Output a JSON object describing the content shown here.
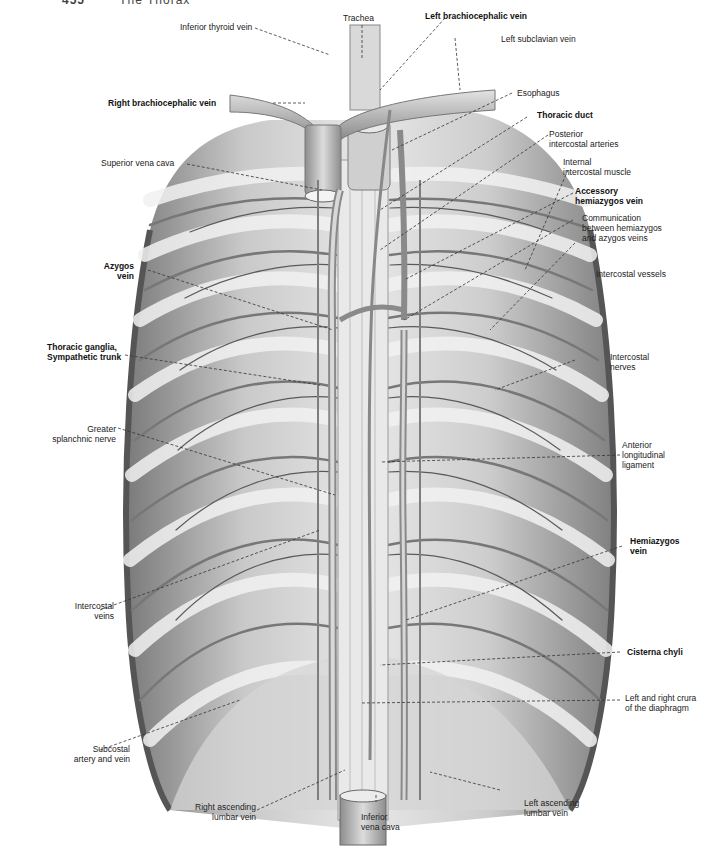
{
  "header": {
    "page_number": "455",
    "chapter": "The Thorax"
  },
  "figure": {
    "palette": {
      "background": "#ffffff",
      "tissue_light": "#d8d8d8",
      "tissue_mid": "#a8a8a8",
      "tissue_dark": "#6e6e6e",
      "vessel": "#9a9a9a",
      "text": "#222222"
    }
  },
  "labels": {
    "trachea": "Trachea",
    "inferior_thyroid_vein": "Inferior thyroid vein",
    "left_brachiocephalic_vein": "Left brachiocephalic vein",
    "left_subclavian_vein": "Left subclavian vein",
    "right_brachiocephalic_vein": "Right brachiocephalic vein",
    "esophagus": "Esophagus",
    "thoracic_duct": "Thoracic duct",
    "superior_vena_cava": "Superior vena cava",
    "posterior_intercostal_arteries": "Posterior\nintercostal arteries",
    "internal_intercostal_muscle": "Internal\nintercostal muscle",
    "accessory_hemiazygos_vein": "Accessory\nhemiazygos vein",
    "communication": "Communication\nbetween hemiazygos\nand azygos veins",
    "azygos_vein": "Azygos\nvein",
    "intercostal_vessels": "Intercostal vessels",
    "thoracic_ganglia": "Thoracic ganglia,\nSympathetic trunk",
    "intercostal_nerves": "Intercostal\nnerves",
    "greater_splanchnic_nerve": "Greater\nsplanchnic nerve",
    "anterior_longitudinal_ligament": "Anterior\nlongitudinal\nligament",
    "hemiazygos_vein": "Hemiazygos\nvein",
    "intercostal_veins": "Intercostal\nveins",
    "cisterna_chyli": "Cisterna chyli",
    "crura": "Left and right crura\nof the diaphragm",
    "subcostal": "Subcostal\nartery and vein",
    "right_ascending_lumbar_vein": "Right ascending\nlumbar vein",
    "inferior_vena_cava": "Inferior\nvena cava",
    "left_ascending_lumbar_vein": "Left ascending\nlumbar vein"
  }
}
